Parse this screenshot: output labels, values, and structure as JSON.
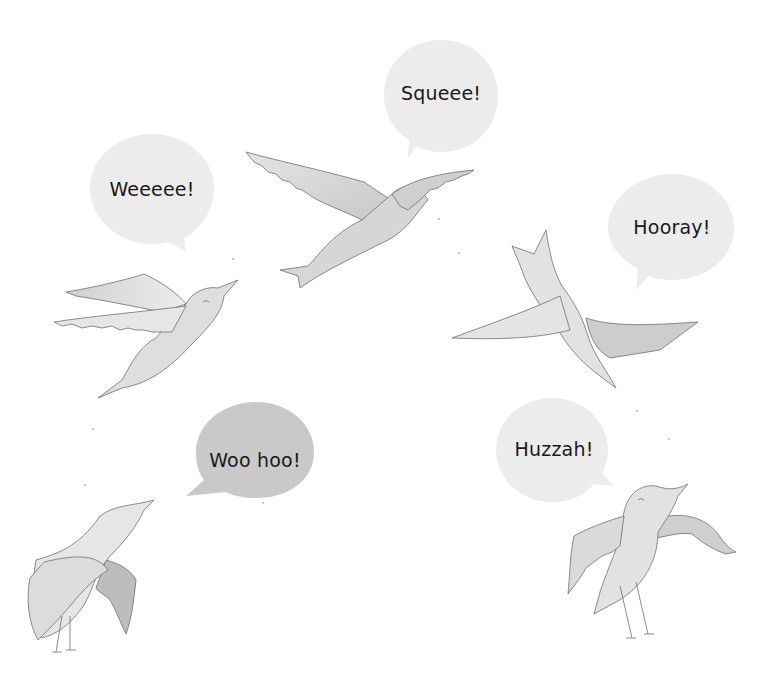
{
  "illustration": {
    "description": "Five watercolor birds flying and perched, each with a speech bubble",
    "background_color": "#ffffff",
    "bubble_color_light": "#ececec",
    "bubble_color_dark": "#c9c9c9",
    "bird_color": "#dcdcdc",
    "bird_outline_color": "#6f6f6f",
    "speech_bubbles": [
      {
        "id": "top-center",
        "text": "Squeee!",
        "shade": "light"
      },
      {
        "id": "upper-left",
        "text": "Weeeee!",
        "shade": "light"
      },
      {
        "id": "upper-right",
        "text": "Hooray!",
        "shade": "light"
      },
      {
        "id": "lower-left",
        "text": "Woo hoo!",
        "shade": "dark"
      },
      {
        "id": "lower-right",
        "text": "Huzzah!",
        "shade": "light"
      }
    ],
    "birds": [
      {
        "id": "top-center",
        "pose": "gliding, wings spread"
      },
      {
        "id": "upper-left",
        "pose": "flying upward"
      },
      {
        "id": "upper-right",
        "pose": "upside down, tail up"
      },
      {
        "id": "lower-left",
        "pose": "perched, looking up"
      },
      {
        "id": "lower-right",
        "pose": "perched, wings open"
      }
    ]
  }
}
